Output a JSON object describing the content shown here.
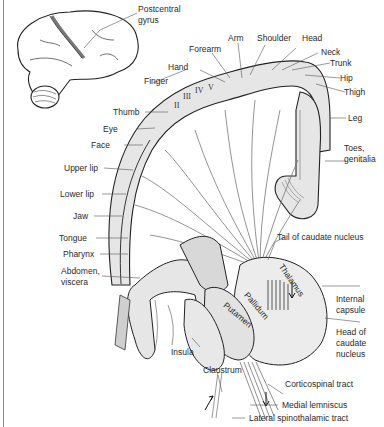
{
  "figure": {
    "colors": {
      "outline": "#222222",
      "fill": "#e6e6e6",
      "fill_dark": "#c8c8c8",
      "leader": "#555555",
      "background": "#ffffff"
    }
  },
  "labels": {
    "postcentral_gyrus_1": "Postcentral",
    "postcentral_gyrus_2": "gyrus",
    "forearm": "Forearm",
    "arm": "Arm",
    "shoulder": "Shoulder",
    "head": "Head",
    "neck": "Neck",
    "trunk": "Trunk",
    "hip": "Hip",
    "thigh": "Thigh",
    "hand": "Hand",
    "finger": "Finger",
    "thumb": "Thumb",
    "eye": "Eye",
    "face": "Face",
    "leg": "Leg",
    "toes_1": "Toes,",
    "toes_2": "genitalia",
    "upper_lip": "Upper lip",
    "lower_lip": "Lower lip",
    "jaw": "Jaw",
    "tongue": "Tongue",
    "pharynx": "Pharynx",
    "abdomen_1": "Abdomen,",
    "abdomen_2": "viscera",
    "tail_caudate": "Tail of caudate nucleus",
    "thalamus": "Thalamus",
    "pallidum": "Pallidum",
    "putamen": "Putamen",
    "internal_capsule_1": "Internal",
    "internal_capsule_2": "capsule",
    "head_caudate_1": "Head of",
    "head_caudate_2": "caudate",
    "head_caudate_3": "nucleus",
    "insula": "Insula",
    "claustrum": "Claustrum",
    "corticospinal": "Corticospinal tract",
    "medial_lemniscus": "Medial lemniscus",
    "lateral_spinothalamic": "Lateral spinothalamic tract"
  },
  "finger_numerals": [
    "II",
    "III",
    "IV",
    "V"
  ]
}
